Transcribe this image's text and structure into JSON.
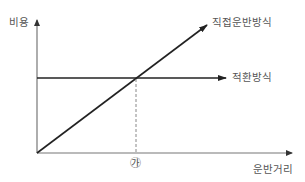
{
  "diagram": {
    "y_axis_label": "비용",
    "x_axis_label": "운반거리",
    "series": [
      {
        "name": "직접운반방식",
        "type": "line",
        "description": "increases linearly from origin"
      },
      {
        "name": "적환방식",
        "type": "line",
        "description": "constant horizontal cost"
      }
    ],
    "intersection_marker": "㉮",
    "colors": {
      "axis": "#777777",
      "line": "#222222",
      "dashed": "#888888",
      "text": "#555555"
    }
  }
}
